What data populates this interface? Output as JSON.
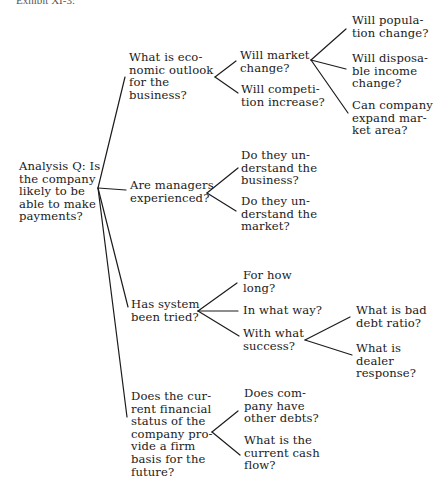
{
  "caption": "Exhibit XI-3:",
  "root": {
    "label": "Analysis Q: Is\nthe company\nlikely to be\nable to make\npayments?"
  },
  "branches": [
    {
      "label": "What is eco-\nnomic outlook\nfor the\nbusiness?",
      "children": [
        {
          "label": "Will market\nchange?",
          "children": [
            {
              "label": "Will popula-\ntion change?"
            },
            {
              "label": "Will disposa-\nble income\nchange?"
            },
            {
              "label": "Can company\nexpand mar-\nket area?"
            }
          ]
        },
        {
          "label": "Will competi-\ntion increase?"
        }
      ]
    },
    {
      "label": "Are managers\nexperienced?",
      "children": [
        {
          "label": "Do they un-\nderstand the\nbusiness?"
        },
        {
          "label": "Do they un-\nderstand the\nmarket?"
        }
      ]
    },
    {
      "label": "Has system\nbeen tried?",
      "children": [
        {
          "label": "For how\nlong?"
        },
        {
          "label": "In what way?"
        },
        {
          "label": "With what\nsuccess?",
          "children": [
            {
              "label": "What is bad\ndebt ratio?"
            },
            {
              "label": "What is\ndealer\nresponse?"
            }
          ]
        }
      ]
    },
    {
      "label": "Does the cur-\nrent financial\nstatus of the\ncompany pro-\nvide a firm\nbasis for the\nfuture?",
      "children": [
        {
          "label": "Does com-\npany have\nother debts?"
        },
        {
          "label": "What is the\ncurrent cash\nflow?"
        }
      ]
    }
  ],
  "colors": {
    "line": "#1c1c1c",
    "text": "#1a1a1a",
    "background": "#ffffff"
  }
}
